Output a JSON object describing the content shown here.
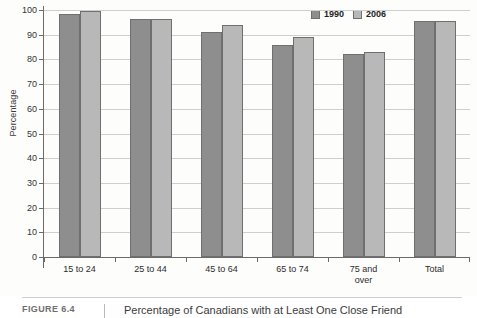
{
  "figure": {
    "number_label": "FIGURE 6.4",
    "caption": "Percentage of Canadians with at Least One Close Friend"
  },
  "legend": {
    "position": "top-right",
    "entries": [
      {
        "label": "1990",
        "color": "#8e8e8e",
        "icon": "legend-swatch-icon"
      },
      {
        "label": "2006",
        "color": "#b8b8b8",
        "icon": "legend-swatch-icon"
      }
    ]
  },
  "chart_data": {
    "type": "bar",
    "title": "Percentage of Canadians with at Least One Close Friend",
    "xlabel": "",
    "ylabel": "Percentage",
    "ylim": [
      0,
      100
    ],
    "ytick_labels": [
      "100",
      "90",
      "80",
      "70",
      "60",
      "50",
      "40",
      "30",
      "20",
      "10",
      "0"
    ],
    "yticks": [
      100,
      90,
      80,
      70,
      60,
      50,
      40,
      30,
      20,
      10,
      0
    ],
    "grid": true,
    "grid_axis": "y",
    "legend_position": "upper right",
    "categories": [
      "15 to 24",
      "25 to 44",
      "45 to 64",
      "65 to 74",
      "75 and\nover",
      "Total"
    ],
    "series": [
      {
        "name": "1990",
        "color": "#8e8e8e",
        "values": [
          98.5,
          96.5,
          91,
          86,
          82,
          95.5
        ]
      },
      {
        "name": "2006",
        "color": "#b8b8b8",
        "values": [
          99.5,
          96.5,
          94,
          89,
          83,
          95.5
        ]
      }
    ]
  }
}
